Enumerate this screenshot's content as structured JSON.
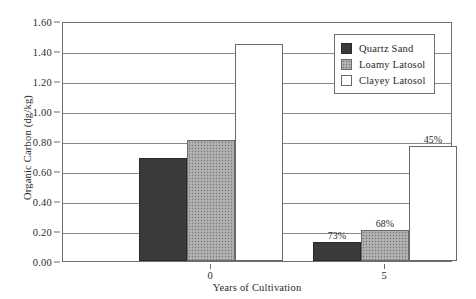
{
  "chart_data": {
    "type": "bar",
    "title": "",
    "subtitle": "",
    "xlabel": "Years of Cultivation",
    "ylabel": "Organic Carbon (dg/kg)",
    "categories": [
      "0",
      "5"
    ],
    "ylim": [
      0.0,
      1.6
    ],
    "ytick_labels": [
      "0.00",
      "0.20",
      "0.40",
      "0.60",
      "0.80",
      "1.00",
      "1.20",
      "1.40",
      "1.60"
    ],
    "ytick_values": [
      0.0,
      0.2,
      0.4,
      0.6,
      0.8,
      1.0,
      1.2,
      1.4,
      1.6
    ],
    "grid": true,
    "legend_position": "top-right-inside",
    "series": [
      {
        "name": "Quartz Sand",
        "fill": "solid-dark",
        "color": "#3a3a3a",
        "values": [
          0.69,
          0.13
        ],
        "labels": [
          "",
          "73%"
        ]
      },
      {
        "name": "Loamy Latosol",
        "fill": "stippled-gray",
        "color": "#a8a8a8",
        "values": [
          0.81,
          0.21
        ],
        "labels": [
          "",
          "68%"
        ]
      },
      {
        "name": "Clayey Latosol",
        "fill": "white",
        "color": "#ffffff",
        "values": [
          1.45,
          0.765
        ],
        "labels": [
          "",
          "45%"
        ]
      }
    ],
    "annotations": [
      "73%",
      "68%",
      "45%"
    ]
  },
  "axes": {
    "y_title": "Organic Carbon (dg/kg)",
    "x_title": "Years of Cultivation",
    "y_ticks": [
      {
        "label": "1.60",
        "value": 1.6
      },
      {
        "label": "1.40",
        "value": 1.4
      },
      {
        "label": "1.20",
        "value": 1.2
      },
      {
        "label": "1.00",
        "value": 1.0
      },
      {
        "label": "0.80",
        "value": 0.8
      },
      {
        "label": "0.60",
        "value": 0.6
      },
      {
        "label": "0.40",
        "value": 0.4
      },
      {
        "label": "0.20",
        "value": 0.2
      },
      {
        "label": "0.00",
        "value": 0.0
      }
    ],
    "x_ticks": [
      {
        "label": "0"
      },
      {
        "label": "5"
      }
    ]
  },
  "legend": {
    "items": [
      {
        "label": "Quartz Sand",
        "swatch": "quartz"
      },
      {
        "label": "Loamy Latosol",
        "swatch": "loamy"
      },
      {
        "label": "Clayey Latosol",
        "swatch": "clayey"
      }
    ]
  },
  "bars": [
    {
      "group": "0",
      "series": "Quartz Sand",
      "cls": "quartz",
      "value": 0.69,
      "label": ""
    },
    {
      "group": "0",
      "series": "Loamy Latosol",
      "cls": "loamy",
      "value": 0.81,
      "label": ""
    },
    {
      "group": "0",
      "series": "Clayey Latosol",
      "cls": "clayey",
      "value": 1.45,
      "label": ""
    },
    {
      "group": "5",
      "series": "Quartz Sand",
      "cls": "quartz",
      "value": 0.13,
      "label": "73%"
    },
    {
      "group": "5",
      "series": "Loamy Latosol",
      "cls": "loamy",
      "value": 0.21,
      "label": "68%"
    },
    {
      "group": "5",
      "series": "Clayey Latosol",
      "cls": "clayey",
      "value": 0.765,
      "label": "45%"
    }
  ]
}
